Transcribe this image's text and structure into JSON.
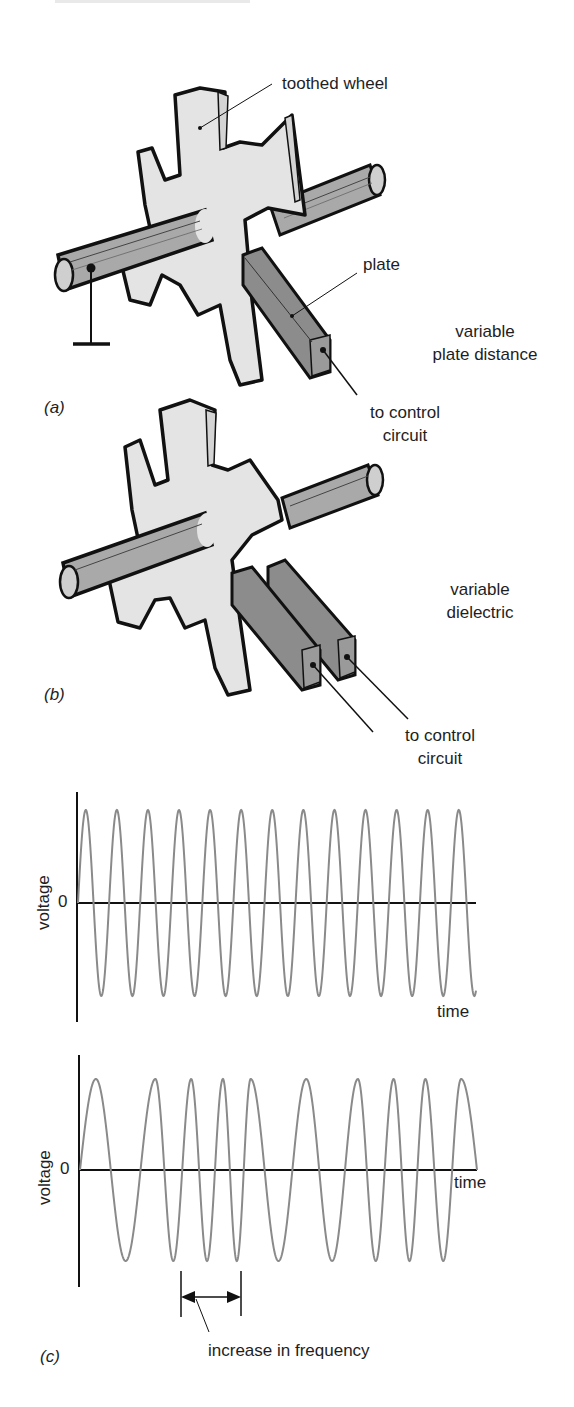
{
  "figure": {
    "panel_a": {
      "caption": "(a)",
      "labels": {
        "wheel": "toothed wheel",
        "plate": "plate",
        "mode_line1": "variable",
        "mode_line2": "plate distance",
        "circuit_line1": "to control",
        "circuit_line2": "circuit"
      }
    },
    "panel_b": {
      "caption": "(b)",
      "labels": {
        "mode_line1": "variable",
        "mode_line2": "dielectric",
        "circuit_line1": "to control",
        "circuit_line2": "circuit"
      }
    },
    "panel_c": {
      "caption": "(c)",
      "annotation": "increase in frequency"
    },
    "colors": {
      "wheel_fill": "#e4e4e4",
      "shaft_fill": "#a9a9a9",
      "plate_fill": "#8c8c8c",
      "outline": "#111111",
      "wave_stroke": "#8a8a8a"
    }
  },
  "chart_data": [
    {
      "type": "line",
      "title": "",
      "xlabel": "time",
      "ylabel": "voltage",
      "y_tick_labels": [
        "0"
      ],
      "grid": false,
      "description": "Constant-frequency sine wave",
      "cycles": 13,
      "amplitude": 1,
      "frequency_profile": "constant"
    },
    {
      "type": "line",
      "title": "",
      "xlabel": "time",
      "ylabel": "voltage",
      "y_tick_labels": [
        "0"
      ],
      "grid": false,
      "description": "Frequency-modulated sine wave",
      "cycles": 10,
      "amplitude": 1,
      "frequency_profile": "varying",
      "peak_x_fraction": [
        0.04,
        0.19,
        0.28,
        0.36,
        0.43,
        0.57,
        0.7,
        0.79,
        0.87,
        0.96
      ],
      "annotation": "increase in frequency"
    }
  ]
}
